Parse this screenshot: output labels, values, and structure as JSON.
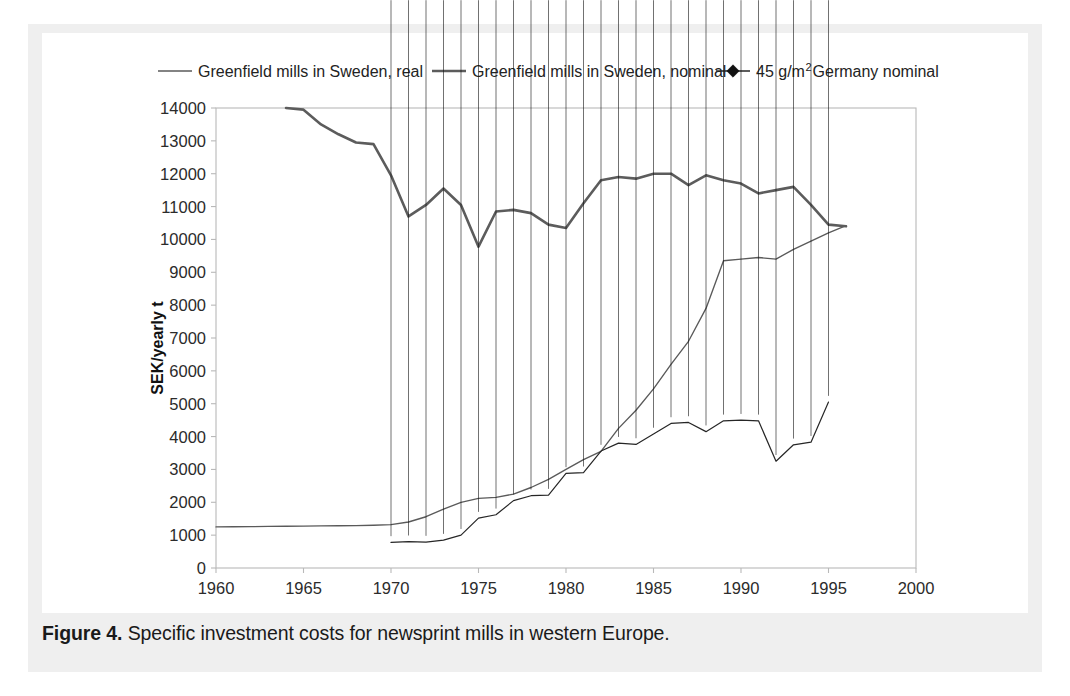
{
  "caption": {
    "figure_number": "Figure 4.",
    "text": "Specific investment costs for newsprint mills in western Europe."
  },
  "colors": {
    "mat": "#efefef",
    "plate": "#ffffff",
    "plot_border": "#b9b9b9",
    "real_line": "#5a5a5a",
    "nominal_line": "#5c5c5c",
    "germany_line": "#262626",
    "marker": "#111111",
    "tick_label": "#2b2b2b"
  },
  "legend": {
    "position": "top",
    "entries": [
      {
        "label": "Greenfield mills in Sweden, real",
        "marker": "line",
        "sample": "thin-line-sample"
      },
      {
        "label": "Greenfield mills in Sweden, nominal",
        "marker": "line",
        "sample": "thick-line-sample"
      },
      {
        "label_pre": "45 g/m",
        "label_sup": "2",
        "label_post": " Germany nominal",
        "label": "45 g/m2 Germany nominal",
        "marker": "line-diamond",
        "sample": "diamond-line-sample"
      }
    ]
  },
  "chart_data": {
    "type": "line",
    "title": "",
    "subtitle": "",
    "xlabel": "",
    "ylabel": "SEK/yearly t",
    "xlim": [
      1960,
      2000
    ],
    "ylim": [
      0,
      14000
    ],
    "xticks": [
      1960,
      1965,
      1970,
      1975,
      1980,
      1985,
      1990,
      1995,
      2000
    ],
    "xtick_labels": [
      "1960",
      "1965",
      "1970",
      "1975",
      "1980",
      "1985",
      "1990",
      "1995",
      "2000"
    ],
    "yticks": [
      0,
      1000,
      2000,
      3000,
      4000,
      5000,
      6000,
      7000,
      8000,
      9000,
      10000,
      11000,
      12000,
      13000,
      14000
    ],
    "ytick_labels": [
      "0",
      "1000",
      "2000",
      "3000",
      "4000",
      "5000",
      "6000",
      "7000",
      "8000",
      "9000",
      "10000",
      "11000",
      "12000",
      "13000",
      "14000"
    ],
    "grid": false,
    "legend_position": "top",
    "series": [
      {
        "name": "Greenfield mills in Sweden, real",
        "style": "thin-line",
        "markers": false,
        "x": [
          1960,
          1961,
          1962,
          1963,
          1964,
          1965,
          1966,
          1967,
          1968,
          1969,
          1970,
          1971,
          1972,
          1973,
          1974,
          1975,
          1976,
          1977,
          1978,
          1979,
          1980,
          1981,
          1982,
          1983,
          1984,
          1985,
          1986,
          1987,
          1988,
          1989,
          1990,
          1991,
          1992,
          1993,
          1994,
          1995,
          1996
        ],
        "y": [
          1250,
          1255,
          1260,
          1265,
          1270,
          1275,
          1280,
          1285,
          1290,
          1300,
          1320,
          1400,
          1560,
          1790,
          2000,
          2120,
          2150,
          2250,
          2450,
          2700,
          3000,
          3300,
          3550,
          4250,
          4800,
          5450,
          6200,
          6900,
          7900,
          9350,
          9400,
          9450,
          9400,
          9700,
          9950,
          10200,
          10420
        ]
      },
      {
        "name": "Greenfield mills in Sweden, nominal",
        "style": "thick-line",
        "markers": false,
        "x": [
          1964,
          1965,
          1966,
          1967,
          1968,
          1969,
          1970,
          1971,
          1972,
          1973,
          1974,
          1975,
          1976,
          1977,
          1978,
          1979,
          1980,
          1981,
          1982,
          1983,
          1984,
          1985,
          1986,
          1987,
          1988,
          1989,
          1990,
          1991,
          1992,
          1993,
          1994,
          1995,
          1996
        ],
        "y": [
          14000,
          13950,
          13500,
          13200,
          12950,
          12900,
          11950,
          10700,
          11050,
          11550,
          11050,
          9780,
          10850,
          10900,
          10800,
          10450,
          10350,
          11100,
          11800,
          11900,
          11850,
          12000,
          12000,
          11650,
          11950,
          11800,
          11700,
          11400,
          11500,
          11600,
          11050,
          10450,
          10400
        ]
      },
      {
        "name": "45 g/m2 Germany nominal",
        "style": "diamond-line",
        "markers": true,
        "x": [
          1970,
          1971,
          1972,
          1973,
          1974,
          1975,
          1976,
          1977,
          1978,
          1979,
          1980,
          1981,
          1982,
          1983,
          1984,
          1985,
          1986,
          1987,
          1988,
          1989,
          1990,
          1991,
          1992,
          1993,
          1994,
          1995
        ],
        "y": [
          780,
          800,
          790,
          850,
          1000,
          1520,
          1620,
          2050,
          2200,
          2220,
          2880,
          2900,
          3560,
          3800,
          3760,
          4080,
          4400,
          4430,
          4150,
          4480,
          4500,
          4480,
          3250,
          3750,
          3830,
          5050
        ]
      }
    ]
  }
}
